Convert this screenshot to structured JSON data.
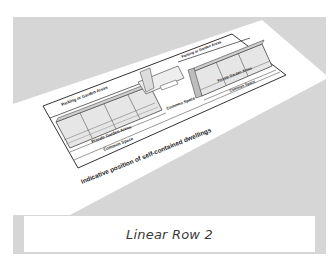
{
  "figure": {
    "caption": "Linear Row 2",
    "colors": {
      "background_panel": "#d6d6d6",
      "paper": "#ffffff",
      "caption_box": "#ffffff",
      "caption_text": "#3a3a3a",
      "line": "#333333",
      "building_fill": "#e6e6e6"
    }
  },
  "diagram": {
    "title": "Indicative position of self-contained dwellings",
    "labels": {
      "parking_left": "Parking or Garden Areas",
      "parking_right": "Parking or Garden Areas",
      "private_garden_left": "Private Garden Areas",
      "private_garden_right": "Private Garden Areas",
      "common_space_left": "Common Space",
      "common_space_center": "Common Space",
      "common_space_right": "Common Space"
    }
  }
}
